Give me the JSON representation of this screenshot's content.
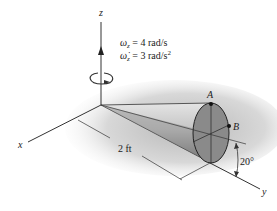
{
  "diagram": {
    "axes": {
      "z": "z",
      "x": "x",
      "y": "y"
    },
    "omega_line": "ω_z = 4 rad/s",
    "omega_label": "ω",
    "omega_sub": "z",
    "omega_value": " = 4 rad/s",
    "alpha_label": "ω̇",
    "alpha_sub": "z",
    "alpha_value": " = 3 rad/s",
    "alpha_exp": "2",
    "points": {
      "A": "A",
      "B": "B"
    },
    "length_label": "2 ft",
    "angle_label": "20°",
    "colors": {
      "cone_light": "#d8d8d8",
      "cone_dark": "#6e6e6e",
      "base": "#8a8a8a",
      "shadow": "#c8c8c8",
      "line": "#333333"
    }
  }
}
